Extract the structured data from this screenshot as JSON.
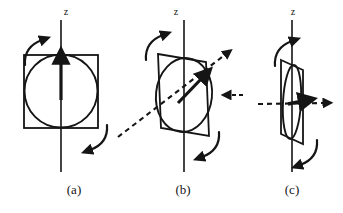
{
  "figure": {
    "type": "diagram",
    "background_color": "#ffffff",
    "stroke_color": "#151515",
    "panel_count": 3
  },
  "panels": [
    {
      "id": "a",
      "label": "(a)",
      "axis_label": "z",
      "tilt_degrees": 0,
      "shape": "square-with-inscribed-circle",
      "face_on": true,
      "has_dashed_axis": false,
      "moment_arrow": "vertical-up-along-z",
      "curved_arrows": [
        "upper-left-ccw",
        "lower-right-cw"
      ]
    },
    {
      "id": "b",
      "label": "(b)",
      "axis_label": "z",
      "tilt_degrees": 35,
      "shape": "parallelogram-with-inscribed-ellipse",
      "face_on": false,
      "has_dashed_axis": true,
      "dashed_axis_direction": "lower-left-to-upper-right",
      "moment_arrow": "tilted-along-dashed-axis",
      "curved_arrows": [
        "upper-left-ccw",
        "lower-right-cw"
      ]
    },
    {
      "id": "c",
      "label": "(c)",
      "axis_label": "z",
      "tilt_degrees": 80,
      "shape": "narrow-parallelogram-edge-on-with-thin-ellipse",
      "face_on": false,
      "has_dashed_axis": true,
      "dashed_axis_direction": "horizontal-left-to-right",
      "moment_arrow": "horizontal-right",
      "curved_arrows": [
        "upper-left-ccw",
        "lower-right-cw"
      ]
    }
  ],
  "colors": {
    "stroke": "#151515",
    "background": "#ffffff"
  }
}
